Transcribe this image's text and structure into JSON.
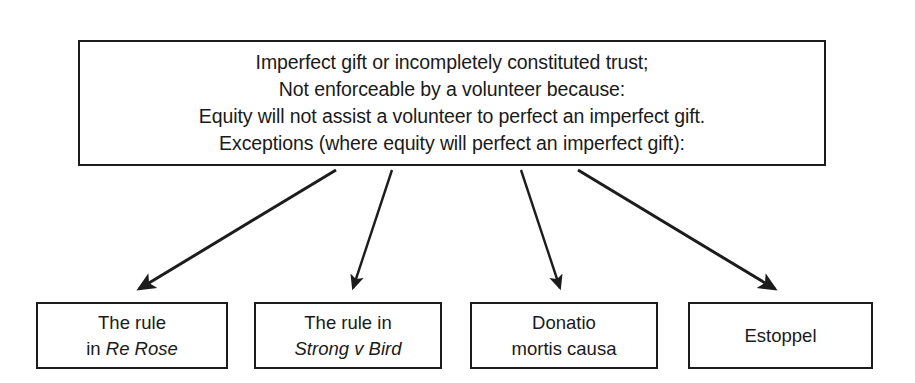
{
  "diagram": {
    "type": "flowchart",
    "colors": {
      "background": "#ffffff",
      "border": "#1c1c1c",
      "text": "#1a1a1a",
      "arrow": "#1c1c1c"
    }
  },
  "top_box": {
    "line1": "Imperfect gift or incompletely constituted trust;",
    "line2": "Not enforceable by a volunteer because:",
    "line3": "Equity will not assist a volunteer to perfect an imperfect gift.",
    "line4": "Exceptions (where equity will perfect an imperfect gift):"
  },
  "leaf_boxes": [
    {
      "id": "re-rose",
      "line1": "The rule",
      "line2_prefix": "in ",
      "line2_italic": "Re Rose",
      "line2_suffix": ""
    },
    {
      "id": "strong-v-bird",
      "line1": "The rule in",
      "line2_prefix": "",
      "line2_italic": "Strong v Bird",
      "line2_suffix": ""
    },
    {
      "id": "donatio-mortis-causa",
      "line1": "Donatio",
      "line2_prefix": "mortis causa",
      "line2_italic": "",
      "line2_suffix": ""
    },
    {
      "id": "estoppel",
      "line1": "Estoppel",
      "line2_prefix": "",
      "line2_italic": "",
      "line2_suffix": ""
    }
  ],
  "arrows": [
    {
      "id": "arrow-to-re-rose",
      "x1": 336,
      "y1": 170,
      "x2": 139,
      "y2": 289
    },
    {
      "id": "arrow-to-strong-v-bird",
      "x1": 392,
      "y1": 170,
      "x2": 353,
      "y2": 288
    },
    {
      "id": "arrow-to-donatio-mortis-causa",
      "x1": 521,
      "y1": 170,
      "x2": 560,
      "y2": 288
    },
    {
      "id": "arrow-to-estoppel",
      "x1": 578,
      "y1": 170,
      "x2": 775,
      "y2": 289
    }
  ]
}
